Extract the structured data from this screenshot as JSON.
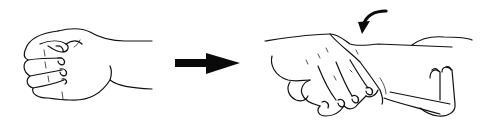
{
  "figure": {
    "panels": [
      {
        "id": "step-1",
        "depiction": "clenched-fist-hand"
      },
      {
        "id": "transition",
        "depiction": "right-arrow"
      },
      {
        "id": "step-2",
        "depiction": "fist-gripping-wrist-with-rotation-arrow"
      }
    ],
    "colors": {
      "ink": "#111111",
      "background": "#ffffff"
    }
  }
}
